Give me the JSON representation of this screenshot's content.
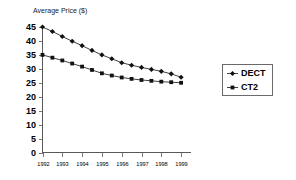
{
  "chart_data": {
    "type": "line",
    "title": "Average Price ($)",
    "xlabel": "",
    "ylabel": "Average Price ($)",
    "ylim": [
      0,
      45
    ],
    "xlim": [
      1992,
      1999.5
    ],
    "grid": false,
    "legend_position": "right",
    "y_ticks": [
      0,
      5,
      10,
      15,
      20,
      25,
      30,
      35,
      40,
      45
    ],
    "x_ticks": [
      1992,
      1993,
      1994,
      1995,
      1996,
      1997,
      1998,
      1999
    ],
    "x": [
      1992.0,
      1992.5,
      1993.0,
      1993.5,
      1994.0,
      1994.5,
      1995.0,
      1995.5,
      1996.0,
      1996.5,
      1997.0,
      1997.5,
      1998.0,
      1998.5,
      1999.0
    ],
    "series": [
      {
        "name": "DECT",
        "marker": "diamond",
        "values": [
          45.0,
          43.4,
          41.6,
          39.9,
          38.3,
          36.6,
          35.0,
          33.6,
          32.2,
          31.3,
          30.5,
          29.8,
          29.1,
          28.2,
          27.0
        ]
      },
      {
        "name": "CT2",
        "marker": "square",
        "values": [
          35.0,
          34.0,
          33.0,
          31.9,
          30.8,
          29.6,
          28.4,
          27.6,
          26.9,
          26.4,
          26.0,
          25.7,
          25.4,
          25.2,
          25.0
        ]
      }
    ]
  },
  "legend": {
    "entries": [
      {
        "label": "DECT"
      },
      {
        "label": "CT2"
      }
    ]
  },
  "colors": {
    "series_line": "#2b2b2b",
    "marker": "#111111",
    "axis": "#5a5a5a",
    "text": "#000000",
    "background": "#ffffff"
  }
}
